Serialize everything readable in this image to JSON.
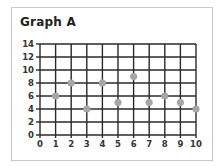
{
  "chart_data": {
    "type": "scatter",
    "title": "Graph A",
    "xlabel": "",
    "ylabel": "",
    "x": [
      1,
      2,
      3,
      4,
      5,
      6,
      7,
      8,
      9,
      10
    ],
    "y": [
      6,
      8,
      4,
      8,
      5,
      9,
      5,
      6,
      5,
      4
    ],
    "xlim": [
      0,
      10
    ],
    "ylim": [
      0,
      14
    ],
    "x_ticks": [
      0,
      1,
      2,
      3,
      4,
      5,
      6,
      7,
      8,
      9,
      10
    ],
    "y_ticks": [
      0,
      2,
      4,
      6,
      8,
      10,
      12,
      14
    ],
    "x_tick_labels": [
      "0",
      "1",
      "2",
      "3",
      "4",
      "5",
      "6",
      "7",
      "8",
      "9",
      "10"
    ],
    "y_tick_labels": [
      "0",
      "2",
      "4",
      "6",
      "8",
      "10",
      "12",
      "14"
    ],
    "grid": true,
    "legend": "none",
    "colors": {
      "point": "#a6a6a6",
      "grid": "#2a2a2a",
      "frame": "#c8c8c8",
      "text": "#333333"
    }
  }
}
